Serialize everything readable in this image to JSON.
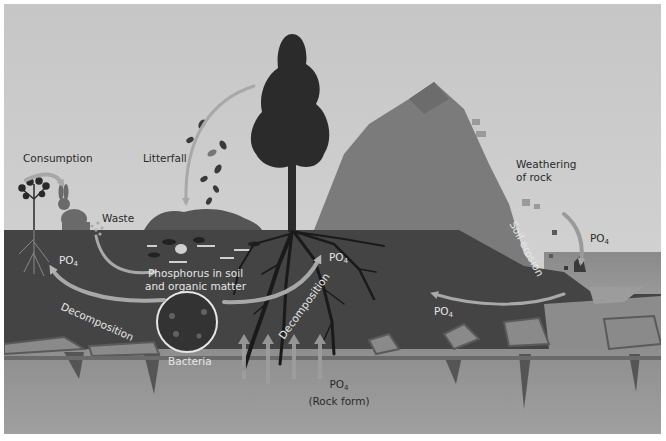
{
  "diagram": {
    "colors": {
      "sky": "#c9c9c9",
      "soil": "#444444",
      "bedrock": "#909090",
      "mountain": "#7d7d7d",
      "water": "#9a9a9a",
      "tree": "#2b2b2b",
      "arrow": "#a8a8a8",
      "label_dark": "#2a2a2a",
      "label_light": "#e6e6e6"
    },
    "labels": {
      "consumption": "Consumption",
      "litterfall": "Litterfall",
      "waste": "Waste",
      "weathering_line1": "Weathering",
      "weathering_line2": "of rock",
      "soil_erosion": "Soil erosion",
      "po4_left": "PO",
      "po4_tree": "PO",
      "po4_right_water": "PO",
      "po4_right_soil": "PO",
      "po4_rock": "PO",
      "subscript": "4",
      "rock_form": "(Rock form)",
      "phosphorus_line1": "Phosphorus in soil",
      "phosphorus_line2": "and organic matter",
      "decomposition_left": "Decomposition",
      "decomposition_tree": "Decomposition",
      "bacteria": "Bacteria"
    },
    "elements": [
      "plant",
      "rabbit",
      "waste-pellets",
      "leaf-litter-mound",
      "falling-leaves",
      "tree",
      "tree-roots",
      "mountain",
      "rock-debris",
      "water-body",
      "bacteria-magnifier",
      "upward-mineral-arrows",
      "bedrock-cracks"
    ]
  }
}
